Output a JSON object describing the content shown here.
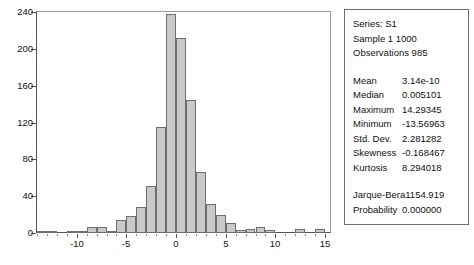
{
  "chart_data": {
    "type": "bar",
    "title": "",
    "xlabel": "",
    "ylabel": "",
    "xlim": [
      -14,
      15.5
    ],
    "ylim": [
      0,
      240
    ],
    "grid": false,
    "legend": false,
    "y_ticks": [
      0,
      40,
      80,
      120,
      160,
      200,
      240
    ],
    "x_ticks": [
      -10,
      -5,
      0,
      5,
      10,
      15
    ],
    "bin_width": 1,
    "bin_centers": [
      -13.5,
      -12.5,
      -11.5,
      -10.5,
      -9.5,
      -8.5,
      -7.5,
      -6.5,
      -5.5,
      -4.5,
      -3.5,
      -2.5,
      -1.5,
      -0.5,
      0.5,
      1.5,
      2.5,
      3.5,
      4.5,
      5.5,
      6.5,
      7.5,
      8.5,
      9.5,
      10.5,
      11.5,
      12.5,
      13.5,
      14.5
    ],
    "values": [
      2,
      2,
      0,
      2,
      2,
      6,
      7,
      2,
      14,
      19,
      28,
      51,
      115,
      238,
      212,
      144,
      66,
      31,
      20,
      11,
      3,
      4,
      6,
      3,
      0,
      0,
      4,
      0,
      4
    ],
    "bar_fill": "#c9c9c9",
    "bar_edge": "#6e6e6e"
  },
  "stats": {
    "header": [
      "Series: S1",
      "Sample 1 1000",
      "Observations 985"
    ],
    "rows": [
      {
        "label": "Mean",
        "value": "3.14e-10"
      },
      {
        "label": "Median",
        "value": "0.005101"
      },
      {
        "label": "Maximum",
        "value": "14.29345"
      },
      {
        "label": "Minimum",
        "value": "-13.56963"
      },
      {
        "label": "Std. Dev.",
        "value": "2.281282"
      },
      {
        "label": "Skewness",
        "value": "-0.168467"
      },
      {
        "label": "Kurtosis",
        "value": "8.294018"
      }
    ],
    "test_rows": [
      {
        "label": "Jarque-Bera",
        "value": "1154.919"
      },
      {
        "label": "Probability",
        "value": "0.000000"
      }
    ]
  }
}
